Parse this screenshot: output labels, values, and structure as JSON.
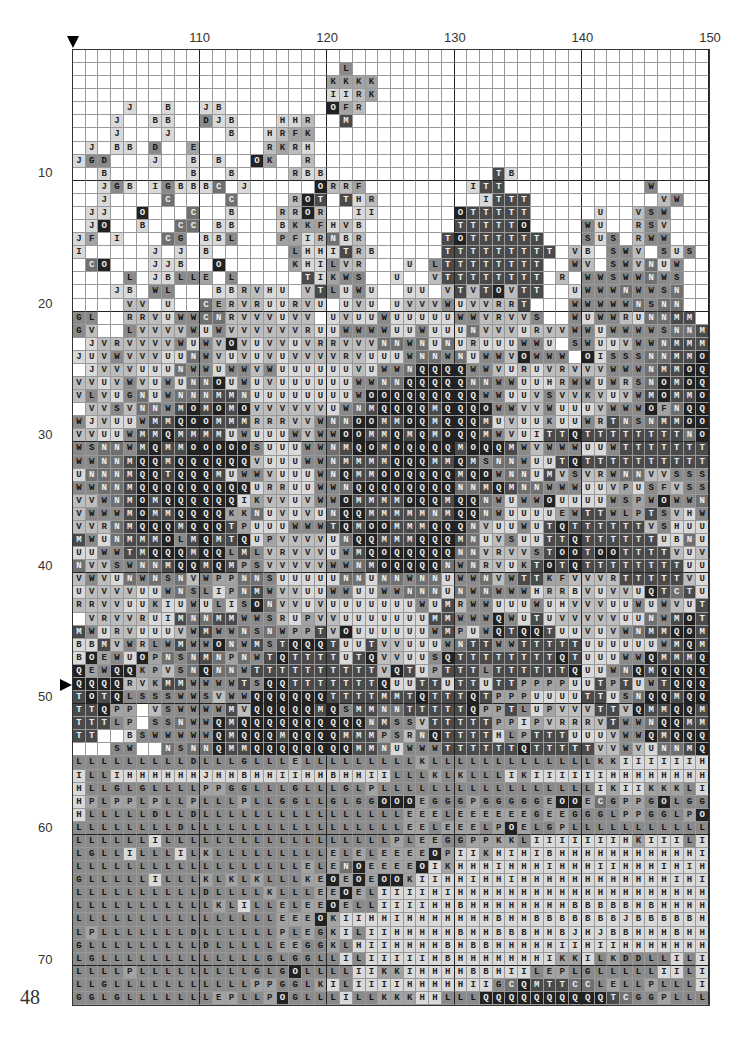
{
  "page_number": "48",
  "column_labels": [
    {
      "label": "110",
      "col": 110
    },
    {
      "label": "120",
      "col": 120
    },
    {
      "label": "130",
      "col": 130
    },
    {
      "label": "140",
      "col": 140
    },
    {
      "label": "150",
      "col": 150
    }
  ],
  "row_labels": [
    {
      "label": "10",
      "row": 10
    },
    {
      "label": "20",
      "row": 20
    },
    {
      "label": "30",
      "row": 30
    },
    {
      "label": "40",
      "row": 40
    },
    {
      "label": "50",
      "row": 50
    },
    {
      "label": "60",
      "row": 60
    },
    {
      "label": "70",
      "row": 70
    }
  ],
  "grid": {
    "first_column": 101,
    "columns": 50,
    "rows": 73,
    "center_marker_column": 101,
    "center_marker_row": 49,
    "symbol_shades": {
      "B": 1,
      "J": 1,
      "H": 1,
      "I": 1,
      "U": 1,
      "V": 2,
      "R": 2,
      "F": 3,
      "K": 3,
      "L": 4,
      "E": 3,
      "P": 3,
      "D": 4,
      "G": 4,
      "C": 5,
      "S": 4,
      "W": 4,
      "N": 5,
      "T": 6,
      "M": 6,
      "O": 7,
      "Q": 7
    },
    "cells": [
      "                                                  ",
      "                     L                            ",
      "                    KKKK                          ",
      "                    IIRK                          ",
      "    J  B  JB        OFR                           ",
      "   J  BB  DJB   HHR  M                            ",
      "   J   J    B  HRFK                               ",
      " J BB D  E     RKRH                               ",
      "JGD   J  B B  OK  R                               ",
      "  B      B  B    RBB             TB               ",
      "  JGB IGBBBC J     ORRF        ITT           W    ",
      "  J    C    C    ROT THR        ITTT          VW  ",
      " JJ  O   C  B   RROR  II      OTTTTT     U  VSW   ",
      " JO  B  CC BB   BKKFHVB       TTTTTO    WU  RSV   ",
      "JF I   CG BBL   PFIRNBR      TOTTTTTT   SUS RWW   ",
      "I     J J B      LHHITRB     TTTTTTTTT VB SWV SUS ",
      " CO   JJB  O     KHILVR   U LTTTTTTTT  WV SWVNUW  ",
      "    L JBLLE L     TIKWS  U  VTTTTTTTT R WWSWWNWS  ",
      "   JB WL   BBRVHU VTLUWU  UU VTVTOVTT  UWWWNWWSN  ",
      "    VV U  CERVRUURVU UVU UVVVWUVVRRT   WWWWWNSNN  ",
      "GL  RRVUWWCNRVVVUVV UVUUWUUUUUWWVRVVS  WUWWRUNNMM ",
      "GV  LVVVVWUWVVVVVVRUUWWWWUUWUUUNVVVURVVWWUWWWWSNNMSO",
      " JVRVVVVWUWVOVUVVUVRRVVVNNWNUNURUUUWWU SWUUVWWNMMMQ",
      "JUVWVVVUUNWVUVUVUVVVVRVUUUWNNWNUWWVOWWW OISSSNNMMOQ",
      " JVVVUUUNWWUWWVWUUUUUUVUWWNQQQQWWVURUVRVVVWWWNMMOQ",
      "VVUVWVUWUNNOUWUVUUUUUUWWNNQQQQQNNWWUUHRWWUWRSNOMOQ",
      "VLVUGNUWNNNMMNUUUUUUUUWOOQQQQQQQWWUUVSVVKVUVWMOMMOQ",
      " VVSVNNWMOMOMOVVVVVVUWNMQQQQMQQQOWWVVWUUUVWWWOFNQQOM",
      "WJVUUWMMQOOMMMRRRVVWNNOOMMOQMQQQMUVUUKUUWRTNSNMMOOM",
      "VVUUWMMQMMMMUWUUUWVWWOOMMQMQMOQQMWVUITTQTTTTTTTTNOOO",
      "WSNNWMQMMOOOOOSUUUWWNMQOMOQQQQMOQQMWVWWWUUWTTTTTTTTMO",
      "WWNNMQQMQQQQQQVUUUWWNMMMMQQQMMQMSNNWUUTQTTTTTTTTTT",
      "UNNNMQQTQQQMUWWVUUUWNQMMOOQQQQMQOWNNUMVSVRWNNVVSSSW",
      "WWNNMQQQQQQQQQURRUUWWNQQQQQQQQNNMQMNNWWWUUVPUSFVSSNW",
      "VVWNMOMQQQQQQIKVVUVWWOMMMMOQQMQQNWUWWOUUUUWSPWOWWNN",
      "VWWWMOMMQQQQKKNUVUVUNQQMMMMMNMQQNWUUUUEWTTWLPTSVHWS",
      "VVRNMQQQMQQQTPUUUWWWTQMOOMMMQQQNVUUWUTQTTTTTTVSHUUW",
      "MWUNMMMOLMQMTQUPVVVVUNQQMMMQQQMNUVSUUTTQTTTTTTUBNUU",
      "UUWWTMQQQMQQLMLVRVVVUWMQOQQQQQNNVRVVSTOOTOOTTTTVUVU",
      "NVVSWNNMQQMQMPSVVVVVWWNMOQQQQNWNRVUKTOTQTTTTTTTTUUU",
      "VWVUNWNSNVWPPNNSUUUUUNNUNNWNNUWWNVWTTKFVVVRTTTTTVUU",
      "UVVVVUUWNSLIPNMWVVUUWWUUWWNNNUNWNWWWHRRBVUVVUQTCTUW",
      "RRVVUUKIUWULISONVVUVUUUUUUUWUMRWWUUUWUHVVVUUWUWVUTTON",
      " VRVVRUIMNNMMWWSRUPVVUUUUUUUMMWWWQWUTUVVVVVUUNWMOTQ",
      "MWURVUUUVWMWWNSNWPPTVOUUUUUUWMPUWQTQQTUUVUVWNMMQOMT",
      "BBMVWRLWMWWONWMSTQQQTUUTVVUUUWNTTWWTTTTTUUUUUUWMQMQQQ",
      "BOEWUOPNSNMNPNWTQTTTTUTQVVUUSQTTTTTTTTQTUUUWWQMMMQQ",
      "QEWQQKPVSNQNNWTTTTTTTTTTVQTUPTTTLTTTTTTQUUWNQMQQQQ",
      "QQQQRVKMMWWWWTSQQTTTTTTTQUUTTUTTUTTPPPPUUTPTUWTQQQQMM",
      "TOTQLSSSWWSVWWQQQQQQTTTTMMTQTTTQTPPPUUUUTTUSNQQMQQQ",
      "TTQPP VSWWWWMVQQQQQMQSMMNNTTTTTQPPTLUPVVVTTVQMMQQMQ",
      "TTTLP SSNWWQMQQQQQQQQQQNMSSVTTTTTPPIPVRRRVTWWNQQMMT",
      "TT  BSWWWWWQMQQQMQQQQMMMPSRNQTTTTHLPTTTUUUVWWQMQQQM",
      "   SW  NSNNQMMQQQQQQQQMMNUWWWTTTTTTQTTTTTVVWVUNNMQM",
      "LLLLLLLLLDLLLGLLLELLLLLLLLLKLLLLLLLLLLLLLKKIIIIIIH",
      "ILLIHHHHHHJHHBHHIIHHBHHIILLLKLKLLLIKIIIIIIHHHHHHHHHJ",
      "HLLGLGLLLLPPGGLLLGLLLGLPLLLLLLLLLLLLLLLLLIKIIKKKLI",
      "HPLPPLPLLPLLLPLLGGLLGLGGOOOEGGGPGGGGGEOOECGPPGOLGGG",
      "HLLLLLDLLDLLLLLLLLLLLLLLLLEEELEEEEEEGEEGGGLPPGGLPOG",
      "LLLLLLLLDLLLLLLLLLLLLLLLLLEELEEELPOELGPLLLLLLLLLLLLL",
      "LLLLLLILLLLLLLLLLLLLLLLLLPLEEGGPPKKLIIIIIIIHKIIILILK",
      "LGLLILLLILKLLLLLLLLLELELEEEEOPIIKHIHIBHHHHHHHHHHHIKLL",
      "LLLLLLLLLLLLLLLLLLELENOEEEEOIKHHHIHHHIHHHIIHHHIHIHH",
      "GLLLLLILLLKLKLKLLLKEOEOEOOKIIHHIHHIHHHHHHHHHHHHIHII",
      "LLLLLLLLLLDLLLLKLLLEEOELIIIIHIHHHHHHHHHHHHHHHHHHHHHH",
      "LLLLLLLLLLLKLILLELEEOELLIIIIHHBHHHHHHHHBBBBBHBHHHH",
      "LLLLLLLLLLLLLLLLEEEOKIIHHIHHHHHHHBHHBBBBBBBJBBBBBH",
      "LPLLLLLLLDLLLLLLPLEGKILIIHHHHHBHHBBBHHBJHJBBHHHBHHB",
      "GLLLLLLLLLDLLLLLEEGGKLHIIHHHHBHBBHHHHHIIHIIHHHHHHHH",
      "LGLLLLLLLLLLLLLGLGGLLILIIIIIHBHHHHHHHIKKILKDDLLILIHH",
      "LLLLPLLLLLLLLLGLGOLLLLIIKKIHHHHBBHIILEPLGLLLLLIILIII",
      "LLGLLLLLLLLLLLPPGGLKILIIIIHHHHHIIGCQMTTCCLELLPLLLIL",
      "GGLGLLLLLLLEPLLPOGLLLILLKKKHHLLLQQQQQQQQQQTCGGPLLLLK",
      "PLGEELELLGGEGLPGPILLLILLILLLLGGQQQQQQQQQQQQMMPLLDLL"
    ]
  }
}
